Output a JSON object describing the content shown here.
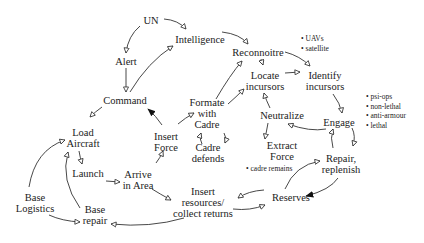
{
  "diagram": {
    "nodes": {
      "un": {
        "label": "UN",
        "x": 151,
        "y": 20
      },
      "intelligence": {
        "label": "Intelligence",
        "x": 200,
        "y": 39
      },
      "alert": {
        "label": "Alert",
        "x": 126,
        "y": 61
      },
      "command": {
        "label": "Command",
        "x": 125,
        "y": 100
      },
      "reconnoitre": {
        "label": "Reconnoitre",
        "x": 258,
        "y": 52
      },
      "locate": {
        "label_line1": "Locate",
        "label_line2": "incursors",
        "x": 265,
        "y": 81
      },
      "identify": {
        "label_line1": "Identify",
        "label_line2": "incursors",
        "x": 325,
        "y": 81
      },
      "formate": {
        "label_line1": "Formate",
        "label_line2": "with",
        "label_line3": "Cadre",
        "x": 207,
        "y": 113
      },
      "neutralize": {
        "label": "Neutralize",
        "x": 282,
        "y": 115
      },
      "engage": {
        "label": "Engage",
        "x": 339,
        "y": 122
      },
      "load": {
        "label_line1": "Load",
        "label_line2": "Aircraft",
        "x": 83,
        "y": 138
      },
      "insert_force": {
        "label_line1": "Insert",
        "label_line2": "Force",
        "x": 166,
        "y": 142
      },
      "cadre_defends": {
        "label_line1": "Cadre",
        "label_line2": "defends",
        "x": 208,
        "y": 153
      },
      "extract": {
        "label_line1": "Extract",
        "label_line2": "Force",
        "x": 282,
        "y": 154
      },
      "repair_replenish": {
        "label_line1": "Repair,",
        "label_line2": "replenish",
        "x": 341,
        "y": 164
      },
      "launch": {
        "label": "Launch",
        "x": 88,
        "y": 173
      },
      "arrive": {
        "label_line1": "Arrive",
        "label_line2": "in Area",
        "x": 138,
        "y": 180
      },
      "base_logistics": {
        "label_line1": "Base",
        "label_line2": "Logistics",
        "x": 35,
        "y": 203
      },
      "insert_resources": {
        "label_line1": "Insert",
        "label_line2": "resources/",
        "label_line3": "collect returns",
        "x": 203,
        "y": 202
      },
      "reserves": {
        "label": "Reserves",
        "x": 291,
        "y": 197
      },
      "base_repair": {
        "label_line1": "Base",
        "label_line2": "repair",
        "x": 95,
        "y": 215
      }
    },
    "notes": {
      "recon_sources": [
        "• UAVs",
        "• satellite"
      ],
      "engage_options": [
        "• psi-ops",
        "• non-lethal",
        "• anti-armour",
        "• lethal"
      ],
      "extract_note": "• cadre remains"
    }
  }
}
